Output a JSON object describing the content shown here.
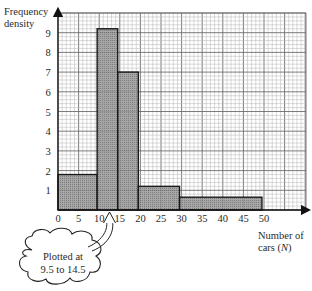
{
  "chart_data": {
    "type": "bar",
    "subtype": "histogram",
    "title": "",
    "xlabel": "Number of cars (N)",
    "ylabel": "Frequency density",
    "xlim": [
      0,
      60
    ],
    "ylim": [
      0,
      10
    ],
    "x_ticks": [
      0,
      5,
      10,
      15,
      20,
      25,
      30,
      35,
      40,
      45,
      50
    ],
    "y_ticks": [
      1,
      2,
      3,
      4,
      5,
      6,
      7,
      8,
      9
    ],
    "grid": true,
    "bins": [
      {
        "from": 0,
        "to": 9.5,
        "frequency_density": 1.8
      },
      {
        "from": 9.5,
        "to": 14.5,
        "frequency_density": 9.2
      },
      {
        "from": 14.5,
        "to": 19.5,
        "frequency_density": 7.0
      },
      {
        "from": 19.5,
        "to": 29.5,
        "frequency_density": 1.2
      },
      {
        "from": 29.5,
        "to": 49.5,
        "frequency_density": 0.65
      }
    ],
    "annotations": [
      {
        "text": "Plotted at 9.5 to 14.5",
        "points_to_x": 12.5
      }
    ]
  },
  "axes": {
    "y_title_line1": "Frequency",
    "y_title_line2": "density",
    "x_title_line1": "Number of",
    "x_title_line2_prefix": "cars (",
    "x_title_var": "N",
    "x_title_line2_suffix": ")"
  },
  "callout": {
    "line1": "Plotted at",
    "line2": "9.5 to 14.5"
  },
  "colors": {
    "bar_fill": "#8a8a8a",
    "bar_edge": "#1a1a1a",
    "grid_minor": "#b5b5b5",
    "grid_major": "#6e6e6e",
    "axis": "#111111"
  }
}
